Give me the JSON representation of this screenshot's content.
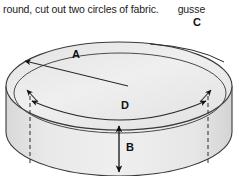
{
  "caption": {
    "main_text": "round, cut out two circles of fabric.",
    "trailing_text": "gusse"
  },
  "figure": {
    "name": "cylinder-pouf-diagram",
    "fill_color": "#ececec",
    "line_color": "#3a3a3a",
    "labels": [
      {
        "id": "A",
        "text": "A",
        "meaning": "radius-arrow",
        "x": 76,
        "y": 44
      },
      {
        "id": "C",
        "text": "C",
        "meaning": "circumference-arc",
        "x": 197,
        "y": 12
      },
      {
        "id": "D",
        "text": "D",
        "meaning": "diameter-arrow",
        "x": 125,
        "y": 95
      },
      {
        "id": "B",
        "text": "B",
        "meaning": "height-arrow",
        "x": 127,
        "y": 133
      }
    ]
  }
}
